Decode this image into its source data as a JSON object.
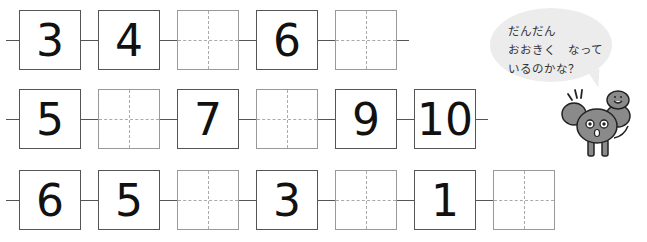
{
  "rows": [
    {
      "boxes": [
        {
          "value": "3"
        },
        {
          "value": "4"
        },
        {
          "value": ""
        },
        {
          "value": "6"
        },
        {
          "value": ""
        }
      ]
    },
    {
      "boxes": [
        {
          "value": "5"
        },
        {
          "value": ""
        },
        {
          "value": "7"
        },
        {
          "value": ""
        },
        {
          "value": "9"
        },
        {
          "value": "10"
        }
      ]
    },
    {
      "boxes": [
        {
          "value": "6"
        },
        {
          "value": "5"
        },
        {
          "value": ""
        },
        {
          "value": "3"
        },
        {
          "value": ""
        },
        {
          "value": "1"
        },
        {
          "value": ""
        }
      ]
    }
  ],
  "speech_bubble": {
    "line1": "だんだん",
    "line2": "おおきく　なって",
    "line3": "いるのかな？"
  },
  "mascot": {
    "icon": "poodle-with-bird-icon"
  }
}
